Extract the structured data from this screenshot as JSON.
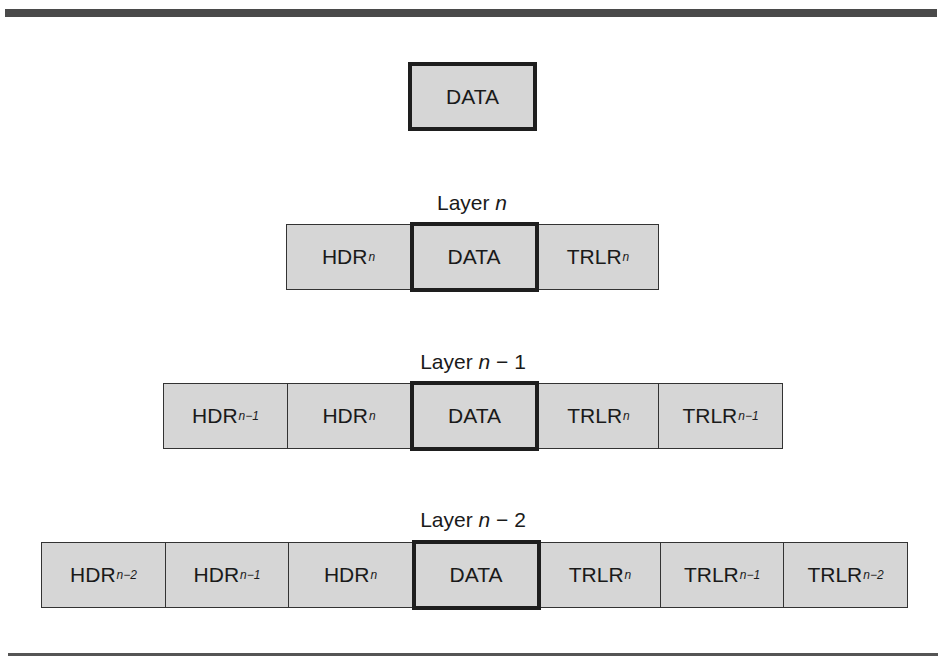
{
  "figure": {
    "data_block": {
      "label": "DATA"
    },
    "layers": [
      {
        "label_prefix": "Layer ",
        "label_var": "n",
        "label_suffix": "",
        "cells": [
          {
            "base": "HDR",
            "sub": "n",
            "kind": "header"
          },
          {
            "base": "DATA",
            "sub": "",
            "kind": "data"
          },
          {
            "base": "TRLR",
            "sub": "n",
            "kind": "trailer"
          }
        ]
      },
      {
        "label_prefix": "Layer ",
        "label_var": "n",
        "label_suffix": " − 1",
        "cells": [
          {
            "base": "HDR",
            "sub": "n−1",
            "kind": "header"
          },
          {
            "base": "HDR",
            "sub": "n",
            "kind": "header"
          },
          {
            "base": "DATA",
            "sub": "",
            "kind": "data"
          },
          {
            "base": "TRLR",
            "sub": "n",
            "kind": "trailer"
          },
          {
            "base": "TRLR",
            "sub": "n−1",
            "kind": "trailer"
          }
        ]
      },
      {
        "label_prefix": "Layer ",
        "label_var": "n",
        "label_suffix": " − 2",
        "cells": [
          {
            "base": "HDR",
            "sub": "n−2",
            "kind": "header"
          },
          {
            "base": "HDR",
            "sub": "n−1",
            "kind": "header"
          },
          {
            "base": "HDR",
            "sub": "n",
            "kind": "header"
          },
          {
            "base": "DATA",
            "sub": "",
            "kind": "data"
          },
          {
            "base": "TRLR",
            "sub": "n",
            "kind": "trailer"
          },
          {
            "base": "TRLR",
            "sub": "n−1",
            "kind": "trailer"
          },
          {
            "base": "TRLR",
            "sub": "n−2",
            "kind": "trailer"
          }
        ]
      }
    ],
    "colors": {
      "cell_fill": "#d6d6d6",
      "border": "#333333",
      "data_border": "#1e1e1e",
      "rule": "#4a4a4a"
    }
  }
}
